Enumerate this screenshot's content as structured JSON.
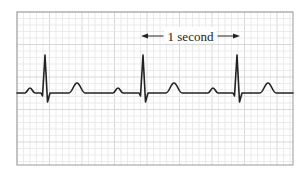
{
  "figure": {
    "scale_label": "1 second",
    "colors": {
      "background": "#ffffff",
      "grid_minor": "#e6e6e6",
      "grid_major": "#cfcfcf",
      "frame": "#9a9a9a",
      "trace": "#222222",
      "label": "#222222"
    },
    "frame": {
      "x": 17,
      "y": 12,
      "width": 276,
      "height": 153
    },
    "grid": {
      "minor_spacing": 6.5,
      "major_every": 5
    },
    "baseline_y": 93,
    "beats": [
      {
        "qrs_x": 45,
        "p_x": 30,
        "t_x": 77
      },
      {
        "qrs_x": 143,
        "p_x": 118,
        "t_x": 174
      },
      {
        "qrs_x": 237,
        "p_x": 213,
        "t_x": 268
      }
    ],
    "scale_bar": {
      "x_start": 141,
      "x_end": 240,
      "y": 36
    }
  }
}
